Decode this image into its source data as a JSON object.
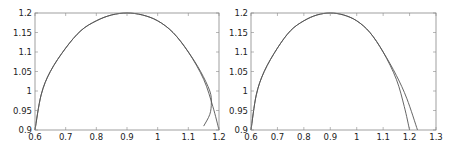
{
  "chart_data": [
    {
      "type": "line",
      "title": "",
      "xlabel": "",
      "ylabel": "",
      "xlim": [
        0.6,
        1.2
      ],
      "ylim": [
        0.9,
        1.2
      ],
      "xticks": [
        "0.6",
        "0.7",
        "0.8",
        "0.9",
        "1",
        "1.1",
        "1.2"
      ],
      "yticks": [
        "0.9",
        "0.95",
        "1",
        "1.05",
        "1.1",
        "1.15",
        "1.2"
      ],
      "grid": false,
      "series": [
        {
          "name": "curve-a",
          "x": [
            0.6,
            0.62,
            0.65,
            0.7,
            0.75,
            0.8,
            0.85,
            0.9,
            0.95,
            1.0,
            1.05,
            1.1,
            1.15,
            1.18,
            1.2
          ],
          "y": [
            0.9,
            0.99,
            1.05,
            1.11,
            1.155,
            1.18,
            1.195,
            1.2,
            1.195,
            1.18,
            1.15,
            1.1,
            1.03,
            0.96,
            0.9
          ]
        },
        {
          "name": "curve-b",
          "x": [
            0.6,
            0.62,
            0.65,
            0.7,
            0.75,
            0.8,
            0.85,
            0.9,
            0.95,
            1.0,
            1.05,
            1.1,
            1.14,
            1.17,
            1.175,
            1.17,
            1.15
          ],
          "y": [
            0.9,
            0.99,
            1.05,
            1.11,
            1.155,
            1.18,
            1.195,
            1.2,
            1.195,
            1.18,
            1.15,
            1.1,
            1.05,
            1.0,
            0.97,
            0.94,
            0.91
          ]
        }
      ]
    },
    {
      "type": "line",
      "title": "",
      "xlabel": "",
      "ylabel": "",
      "xlim": [
        0.6,
        1.3
      ],
      "ylim": [
        0.9,
        1.2
      ],
      "xticks": [
        "0.6",
        "0.7",
        "0.8",
        "0.9",
        "1",
        "1.1",
        "1.2",
        "1.3"
      ],
      "yticks": [
        "0.9",
        "0.95",
        "1",
        "1.05",
        "1.1",
        "1.15",
        "1.2"
      ],
      "grid": false,
      "series": [
        {
          "name": "curve-a",
          "x": [
            0.6,
            0.62,
            0.65,
            0.7,
            0.75,
            0.8,
            0.85,
            0.9,
            0.95,
            1.0,
            1.05,
            1.1,
            1.15,
            1.18,
            1.2
          ],
          "y": [
            0.9,
            0.99,
            1.05,
            1.11,
            1.155,
            1.18,
            1.195,
            1.2,
            1.195,
            1.18,
            1.15,
            1.1,
            1.03,
            0.96,
            0.9
          ]
        },
        {
          "name": "curve-b",
          "x": [
            0.6,
            0.62,
            0.65,
            0.7,
            0.75,
            0.8,
            0.85,
            0.9,
            0.95,
            1.0,
            1.05,
            1.1,
            1.15,
            1.19,
            1.23
          ],
          "y": [
            0.9,
            0.99,
            1.05,
            1.11,
            1.155,
            1.18,
            1.195,
            1.2,
            1.195,
            1.18,
            1.15,
            1.1,
            1.04,
            0.98,
            0.9
          ]
        }
      ]
    }
  ],
  "colors": {
    "curve": "#555555",
    "axes": "#888888",
    "text": "#222222"
  }
}
